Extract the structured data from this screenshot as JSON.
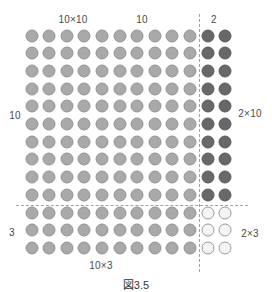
{
  "diagram": {
    "grid": {
      "columns": 12,
      "rows": 13,
      "origin_x": 31.5,
      "origin_y": 35.5,
      "col_spacing": 17.6,
      "row_spacing": 17.7
    },
    "regions": [
      {
        "name": "10x10",
        "cols": [
          0,
          9
        ],
        "rows": [
          0,
          9
        ],
        "style": "light"
      },
      {
        "name": "2x10",
        "cols": [
          10,
          11
        ],
        "rows": [
          0,
          9
        ],
        "style": "dark"
      },
      {
        "name": "10x3",
        "cols": [
          0,
          9
        ],
        "rows": [
          10,
          12
        ],
        "style": "light"
      },
      {
        "name": "2x3",
        "cols": [
          10,
          11
        ],
        "rows": [
          10,
          12
        ],
        "style": "empty"
      }
    ],
    "colors": {
      "light": "#a9a9a9",
      "dark": "#686868",
      "empty": "#f4f4f4",
      "divider": "#a0a0a0"
    },
    "labels": {
      "top_left_product": "10×10",
      "top_width": "10",
      "top_right_width": "2",
      "left_height_top": "10",
      "left_height_bottom": "3",
      "right_top_product": "2×10",
      "right_bottom_product": "2×3",
      "bottom_left_product": "10×3"
    },
    "caption": "図3.5"
  }
}
